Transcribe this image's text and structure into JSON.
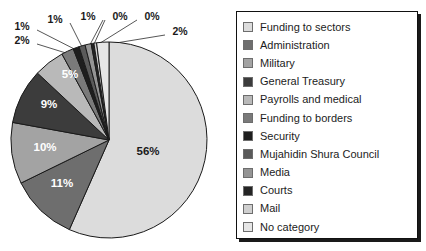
{
  "chart_data": {
    "type": "pie",
    "title": "",
    "start_angle_deg": 0,
    "direction": "clockwise",
    "legend_position": "right",
    "grid": false,
    "categories": [
      "Funding to sectors",
      "Administration",
      "Military",
      "General Treasury",
      "Payrolls and medical",
      "Funding to borders",
      "Security",
      "Mujahidin Shura Council",
      "Media",
      "Courts",
      "Mail",
      "No category"
    ],
    "values": [
      56,
      11,
      10,
      9,
      5,
      2,
      1,
      1,
      1,
      0,
      0,
      2
    ],
    "value_labels": [
      "56%",
      "11%",
      "10%",
      "9%",
      "5%",
      "2%",
      "1%",
      "1%",
      "1%",
      "0%",
      "0%",
      "2%"
    ],
    "colors": [
      "#dcdcdc",
      "#6e6e6e",
      "#a3a3a3",
      "#3c3c3c",
      "#b9b9b9",
      "#7a7a7a",
      "#1e1e1e",
      "#5a5a5a",
      "#949494",
      "#242424",
      "#cfcfcf",
      "#e6e6e6"
    ],
    "slice_edge_color": "#1a1a1a"
  },
  "pie": {
    "inner_labels": [
      {
        "text": "56%",
        "x": 148,
        "y": 155,
        "tone": "dark"
      },
      {
        "text": "11%",
        "x": 62,
        "y": 187,
        "tone": "light"
      },
      {
        "text": "10%",
        "x": 45,
        "y": 151,
        "tone": "light"
      },
      {
        "text": "9%",
        "x": 49,
        "y": 108,
        "tone": "light"
      },
      {
        "text": "5%",
        "x": 70,
        "y": 78,
        "tone": "light"
      }
    ],
    "callouts": [
      {
        "text": "2%",
        "x": 22,
        "y": 40
      },
      {
        "text": "1%",
        "x": 22,
        "y": 26
      },
      {
        "text": "1%",
        "x": 55,
        "y": 19
      },
      {
        "text": "1%",
        "x": 88,
        "y": 16
      },
      {
        "text": "0%",
        "x": 120,
        "y": 16
      },
      {
        "text": "0%",
        "x": 152,
        "y": 16
      },
      {
        "text": "2%",
        "x": 180,
        "y": 31
      }
    ]
  },
  "legend": {
    "items": [
      {
        "label": "Funding to sectors",
        "color": "#dcdcdc"
      },
      {
        "label": "Administration",
        "color": "#6e6e6e"
      },
      {
        "label": "Military",
        "color": "#a3a3a3"
      },
      {
        "label": "General Treasury",
        "color": "#3c3c3c"
      },
      {
        "label": "Payrolls and medical",
        "color": "#b9b9b9"
      },
      {
        "label": "Funding to borders",
        "color": "#7a7a7a"
      },
      {
        "label": "Security",
        "color": "#1e1e1e"
      },
      {
        "label": "Mujahidin Shura Council",
        "color": "#5a5a5a"
      },
      {
        "label": "Media",
        "color": "#949494"
      },
      {
        "label": "Courts",
        "color": "#242424"
      },
      {
        "label": "Mail",
        "color": "#cfcfcf"
      },
      {
        "label": "No category",
        "color": "#e6e6e6"
      }
    ]
  }
}
